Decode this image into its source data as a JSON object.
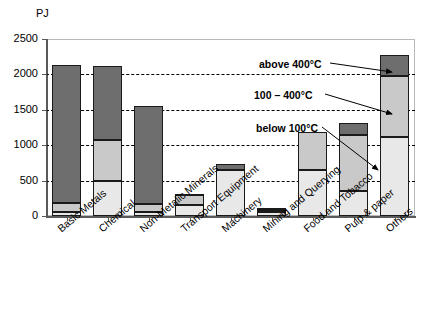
{
  "chart_data": {
    "type": "bar",
    "subtype": "stacked-bar",
    "title": "",
    "xlabel": "",
    "ylabel": "PJ",
    "unit": "PJ",
    "ylim": [
      0,
      2500
    ],
    "yticks": [
      0,
      500,
      1000,
      1500,
      2000,
      2500
    ],
    "ytick_labels": [
      "0",
      "500",
      "1000",
      "1500",
      "2000",
      "2500"
    ],
    "grid": "horizontal-dashed",
    "legend_position": "in-plot-annotations",
    "categories": [
      "Basic Metals",
      "Chemical",
      "Non-Metalic Minerals",
      "Transport Equipment",
      "Machinery",
      "Mining and Querying",
      "Food and Tobacco",
      "Pulp & paper",
      "Others"
    ],
    "series": [
      {
        "name": "below 100°C",
        "color": "#e8e8e8",
        "values": [
          60,
          490,
          50,
          150,
          650,
          50,
          650,
          350,
          1120
        ]
      },
      {
        "name": "100 – 400°C",
        "color": "#c9c9c9",
        "values": [
          120,
          580,
          120,
          140,
          0,
          30,
          540,
          790,
          860
        ]
      },
      {
        "name": "above 400°C",
        "color": "#6e6e6e",
        "values": [
          1950,
          1050,
          1390,
          20,
          80,
          30,
          0,
          180,
          300
        ]
      }
    ],
    "totals": [
      2130,
      2120,
      1560,
      310,
      730,
      110,
      1190,
      1320,
      2280
    ],
    "annotations": [
      {
        "label": "above 400°C",
        "points_to": "Others top segment"
      },
      {
        "label": "100 – 400°C",
        "points_to": "Others middle segment"
      },
      {
        "label": "below 100°C",
        "points_to": "Others bottom segment"
      }
    ]
  },
  "axis": {
    "unit_label": "PJ"
  }
}
